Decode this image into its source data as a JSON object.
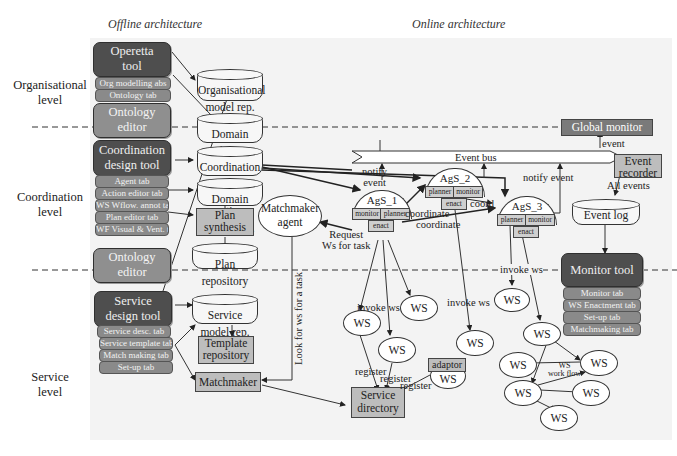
{
  "headers": {
    "offline": "Offline architecture",
    "online": "Online architecture"
  },
  "levels": {
    "organisational": [
      "Organisational",
      "level"
    ],
    "coordination": [
      "Coordination",
      "level"
    ],
    "service": [
      "Service",
      "level"
    ]
  },
  "offline": {
    "operetta": {
      "title": [
        "Operetta",
        "tool"
      ],
      "tabs": [
        "Org modelling abs",
        "Ontology tab"
      ]
    },
    "ontology_editor_1": [
      "Ontology",
      "editor"
    ],
    "coordination_tool": {
      "title": [
        "Coordination",
        "design tool"
      ],
      "tabs": [
        "Agent tab",
        "Action editor tab",
        "WS Wflow. annot tab",
        "Plan editor tab",
        "WF Visual & Vent. tab"
      ]
    },
    "ontology_editor_2": [
      "Ontology",
      "editor"
    ],
    "service_tool": {
      "title": [
        "Service",
        "design tool"
      ],
      "tabs": [
        "Service desc. tab",
        "Service template tab",
        "Match making tab",
        "Set-up tab"
      ]
    },
    "repos": {
      "org_model": [
        "Organisational",
        "model rep."
      ],
      "domain_ontology": [
        "Domain",
        "ontology rep."
      ],
      "coordination_model": [
        "Coordination",
        "model rep."
      ],
      "domain_action": [
        "Domain action",
        "model rep."
      ],
      "plan_synthesis": [
        "Plan",
        "synthesis"
      ],
      "plan_repository": [
        "Plan",
        "repository"
      ],
      "service_model": [
        "Service",
        "model rep."
      ],
      "template_repository": [
        "Template",
        "repository"
      ],
      "matchmaker": "Matchmaker"
    }
  },
  "online": {
    "global_monitor": "Global monitor",
    "event_bus": "Event bus",
    "event_recorder": [
      "Event",
      "recorder"
    ],
    "event_log": "Event log",
    "matchmaker_agent": [
      "Matchmaker",
      "agent"
    ],
    "service_directory": [
      "Service",
      "directory"
    ],
    "adaptor": "adaptor",
    "agents": [
      {
        "name": "AgS_1",
        "parts": [
          "monitor",
          "planner",
          "enact"
        ]
      },
      {
        "name": "AgS_2",
        "parts": [
          "planner",
          "monitor",
          "enact"
        ]
      },
      {
        "name": "AgS_3",
        "parts": [
          "planner",
          "monitor",
          "enact"
        ]
      }
    ],
    "monitor_tool": {
      "title": "Monitor tool",
      "tabs": [
        "Monitor tab",
        "WS Enactment tab",
        "Set-up tab",
        "Matchmaking tab"
      ]
    },
    "ws_label": "WS",
    "edge_labels": {
      "event": "event",
      "all_events": "All events",
      "notify_event_1": [
        "notify",
        "event"
      ],
      "notify_event_2": "notify event",
      "coordinate_1": "coordinate",
      "coordinate_2": "coordinate",
      "coord": "coord",
      "request": [
        "Request",
        "Ws for task"
      ],
      "look_for": "Look for ws for a task",
      "invoke_ws_1": "invoke ws",
      "invoke_ws_2": "invoke ws",
      "invoke_ws_3": "invoke ws",
      "register_1": "register",
      "register_2": "register",
      "register_3": "register",
      "ws_workflow": [
        "WS",
        "work flow"
      ]
    }
  }
}
